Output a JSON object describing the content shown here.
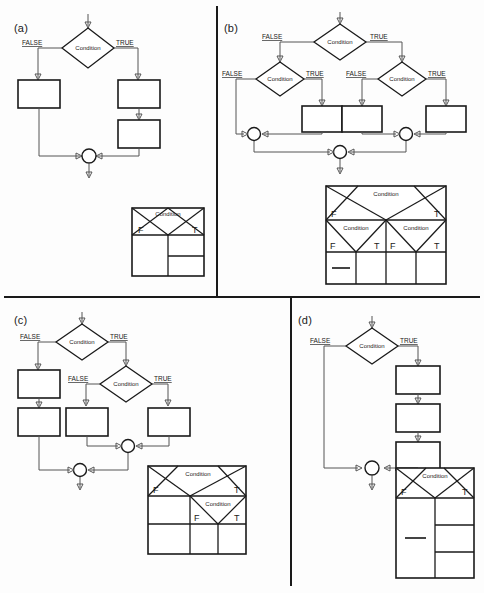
{
  "figure": {
    "background": "#fdfdfd",
    "line_color": "#555555",
    "shape_color": "#1a1a1a"
  },
  "labels": {
    "condition": "Condition",
    "false_label": "FALSE",
    "true_label": "TRUE",
    "f_short": "F",
    "t_short": "T",
    "dash": "—"
  },
  "panels": [
    {
      "id": "a",
      "tag": "(a)",
      "flowchart": {
        "decisions": [
          {
            "name": "root-condition",
            "text": "Condition",
            "false_label": "FALSE",
            "true_label": "TRUE"
          }
        ],
        "false_branch_boxes": 1,
        "true_branch_boxes": 2,
        "merge_circles": 1
      },
      "table": {
        "header": "Condition",
        "columns": [
          "F",
          "T"
        ],
        "body_left_cells": 1,
        "body_right_cells": 2,
        "dash_cells": []
      }
    },
    {
      "id": "b",
      "tag": "(b)",
      "flowchart": {
        "decisions": [
          {
            "name": "root-condition",
            "text": "Condition",
            "false_label": "FALSE",
            "true_label": "TRUE"
          },
          {
            "name": "left-condition",
            "text": "Condition",
            "false_label": "FALSE",
            "true_label": "TRUE"
          },
          {
            "name": "right-condition",
            "text": "Condition",
            "false_label": "FALSE",
            "true_label": "TRUE"
          }
        ],
        "boxes": 3,
        "merge_circles": 3
      },
      "table": {
        "header": "Condition",
        "columns": [
          "F",
          "T"
        ],
        "sub_headers": [
          "Condition",
          "Condition"
        ],
        "sub_columns": [
          "F",
          "T",
          "F",
          "T"
        ],
        "body_cells": 4,
        "dash_cells": [
          0
        ]
      }
    },
    {
      "id": "c",
      "tag": "(c)",
      "flowchart": {
        "decisions": [
          {
            "name": "root-condition",
            "text": "Condition",
            "false_label": "FALSE",
            "true_label": "TRUE"
          },
          {
            "name": "inner-condition",
            "text": "Condition",
            "false_label": "FALSE",
            "true_label": "TRUE"
          }
        ],
        "false_branch_boxes": 2,
        "inner_false_boxes": 1,
        "inner_true_boxes": 1,
        "merge_circles": 2
      },
      "table": {
        "header": "Condition",
        "columns": [
          "F",
          "T"
        ],
        "sub_header": "Condition",
        "sub_columns": [
          "F",
          "T"
        ],
        "body_cells": 3,
        "dash_cells": []
      }
    },
    {
      "id": "d",
      "tag": "(d)",
      "flowchart": {
        "decisions": [
          {
            "name": "root-condition",
            "text": "Condition",
            "false_label": "FALSE",
            "true_label": "TRUE"
          }
        ],
        "false_branch_boxes": 0,
        "true_branch_boxes": 3,
        "merge_circles": 1
      },
      "table": {
        "header": "Condition",
        "columns": [
          "F",
          "T"
        ],
        "body_left_cells": 1,
        "body_right_cells": 3,
        "dash_cells": [
          "left"
        ]
      }
    }
  ]
}
